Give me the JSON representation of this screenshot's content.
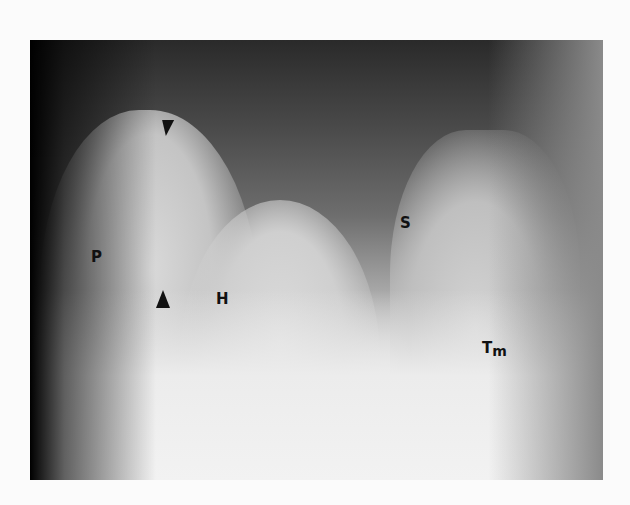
{
  "figure": {
    "labels": {
      "p": "P",
      "h": "H",
      "s": "S",
      "tm_main": "T",
      "tm_sub": "m"
    },
    "markers": [
      "arrowhead-down",
      "arrowhead-up"
    ]
  }
}
